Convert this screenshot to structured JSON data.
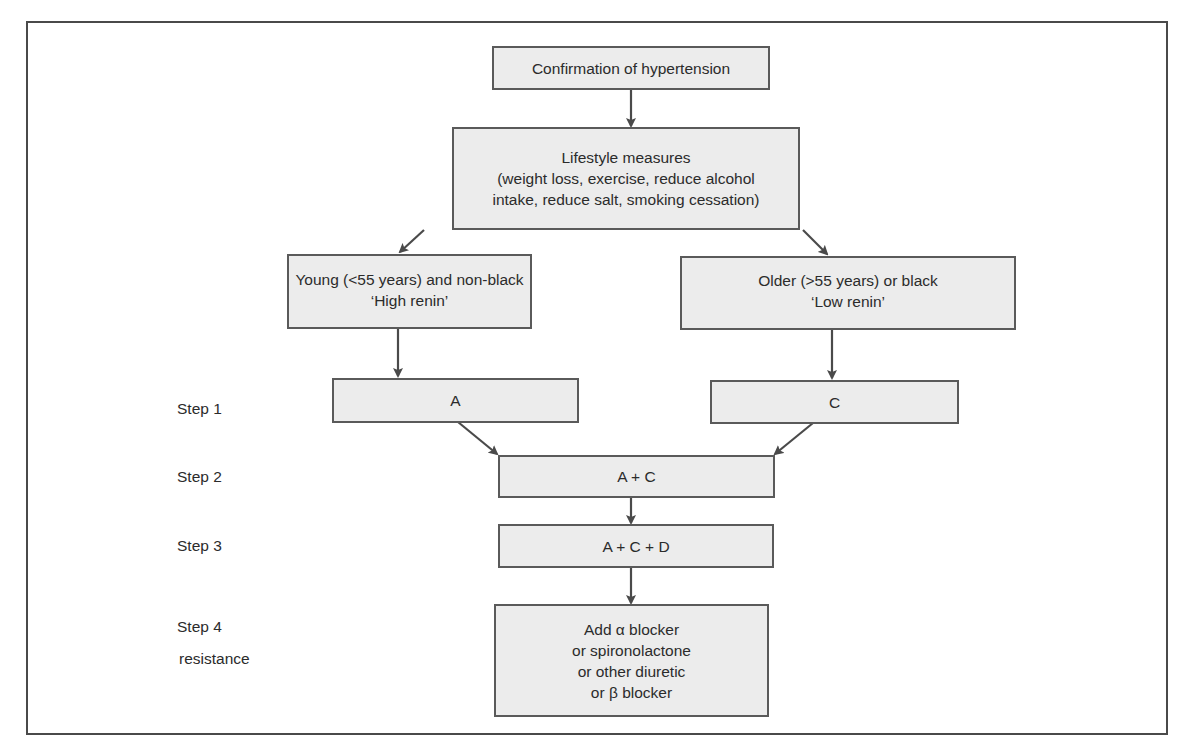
{
  "diagram": {
    "type": "flowchart",
    "title": "",
    "colors": {
      "box_fill": "#ececec",
      "box_border": "#5a5a5a",
      "arrow": "#4a4a4a",
      "frame": "#4a4a4a",
      "text": "#2b2b2b"
    },
    "nodes": {
      "confirmation": {
        "lines": [
          "Confirmation of hypertension"
        ]
      },
      "lifestyle": {
        "lines": [
          "Lifestyle measures",
          "(weight loss, exercise, reduce alcohol",
          "intake, reduce salt, smoking cessation)"
        ]
      },
      "young": {
        "lines": [
          "Young (<55 years) and non-black",
          "‘High renin’"
        ]
      },
      "older": {
        "lines": [
          "Older (>55 years) or black",
          "‘Low renin’"
        ]
      },
      "step1_a": {
        "lines": [
          "A"
        ]
      },
      "step1_c": {
        "lines": [
          "C"
        ]
      },
      "step2": {
        "lines": [
          "A + C"
        ]
      },
      "step3": {
        "lines": [
          "A + C + D"
        ]
      },
      "step4": {
        "lines": [
          "Add α blocker",
          "or spironolactone",
          "or other diuretic",
          "or β blocker"
        ]
      }
    },
    "step_labels": {
      "step1": "Step 1",
      "step2": "Step 2",
      "step3": "Step 3",
      "step4": "Step 4",
      "step4_sub": "resistance"
    },
    "edges": [
      {
        "from": "confirmation",
        "to": "lifestyle"
      },
      {
        "from": "lifestyle",
        "to": "young"
      },
      {
        "from": "lifestyle",
        "to": "older"
      },
      {
        "from": "young",
        "to": "step1_a"
      },
      {
        "from": "older",
        "to": "step1_c"
      },
      {
        "from": "step1_a",
        "to": "step2"
      },
      {
        "from": "step1_c",
        "to": "step2"
      },
      {
        "from": "step2",
        "to": "step3"
      },
      {
        "from": "step3",
        "to": "step4"
      }
    ]
  }
}
